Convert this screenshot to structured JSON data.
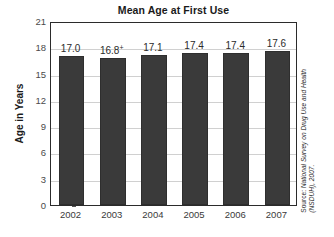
{
  "chart_data": {
    "type": "bar",
    "title": "Mean Age at First Use",
    "xlabel": "",
    "ylabel": "Age in Years",
    "categories": [
      "2002",
      "2003",
      "2004",
      "2005",
      "2006",
      "2007"
    ],
    "values": [
      17.0,
      16.8,
      17.1,
      17.4,
      17.4,
      17.6
    ],
    "value_labels": [
      "17.0",
      "16.8",
      "17.1",
      "17.4",
      "17.4",
      "17.6"
    ],
    "value_label_marks": [
      "",
      "+",
      "",
      "",
      "",
      ""
    ],
    "ylim": [
      0,
      21
    ],
    "yticks": [
      0,
      3,
      6,
      9,
      12,
      15,
      18,
      21
    ],
    "ytick_labels": [
      "0",
      "3",
      "6",
      "9",
      "12",
      "15",
      "18",
      "21"
    ],
    "grid": true,
    "legend": "none",
    "bar_color": "#3a3a3a",
    "gridline_color": "#d0d0d0",
    "axis_color": "#2b2b2b"
  },
  "source": {
    "label": "Source: ",
    "line1": "National Survey on Drug Use and Health",
    "line2": "(NSDUH), 2007."
  }
}
